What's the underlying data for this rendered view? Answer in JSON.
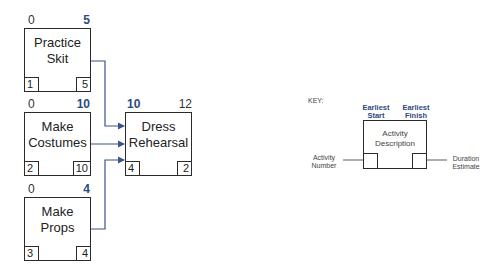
{
  "activities": [
    {
      "id": "practice-skit",
      "description": "Practice\nSkit",
      "earliest_start": "0",
      "earliest_finish": "5",
      "activity_number": "1",
      "duration": "5"
    },
    {
      "id": "make-costumes",
      "description": "Make\nCostumes",
      "earliest_start": "0",
      "earliest_finish": "10",
      "activity_number": "2",
      "duration": "10"
    },
    {
      "id": "make-props",
      "description": "Make\nProps",
      "earliest_start": "0",
      "earliest_finish": "4",
      "activity_number": "3",
      "duration": "4"
    },
    {
      "id": "dress-rehearsal",
      "description": "Dress\nRehearsal",
      "earliest_start": "10",
      "earliest_finish": "12",
      "activity_number": "4",
      "duration": "2"
    }
  ],
  "edges": [
    {
      "from": "practice-skit",
      "to": "dress-rehearsal"
    },
    {
      "from": "make-costumes",
      "to": "dress-rehearsal"
    },
    {
      "from": "make-props",
      "to": "dress-rehearsal"
    }
  ],
  "key": {
    "title": "KEY:",
    "earliest_start": "Earliest\nStart",
    "earliest_finish": "Earliest\nFinish",
    "activity_description": "Activity\nDescription",
    "activity_number": "Activity\nNumber",
    "duration_estimate": "Duration\nEstimate"
  },
  "colors": {
    "line": "#3c5488",
    "accent_text": "#2e4a7d",
    "border": "#2b2b2b"
  }
}
